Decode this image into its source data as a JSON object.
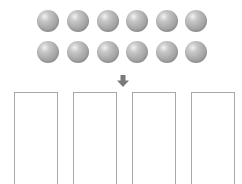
{
  "diagram": {
    "balls": {
      "rows": 2,
      "per_row": 6,
      "total": 12,
      "color": "#a9a9a9"
    },
    "arrow": {
      "direction": "down",
      "color": "#7a7a7a",
      "icon": "arrow-down-icon"
    },
    "containers": {
      "count": 4,
      "border_color": "#a8a8a8"
    }
  }
}
